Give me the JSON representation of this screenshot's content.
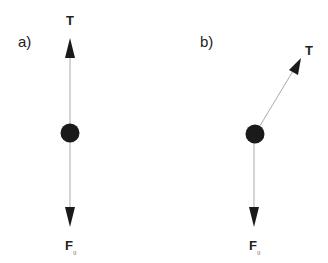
{
  "panels": [
    {
      "label": "a)",
      "tension_label": "T",
      "gravity_label": "F",
      "gravity_subscript": "g",
      "tension_direction": "vertical-up"
    },
    {
      "label": "b)",
      "tension_label": "T",
      "gravity_label": "F",
      "gravity_subscript": "g",
      "tension_direction": "diagonal-up-right"
    }
  ],
  "colors": {
    "ball": "#1a1a1a",
    "line": "#999999",
    "arrowhead": "#1a1a1a"
  }
}
